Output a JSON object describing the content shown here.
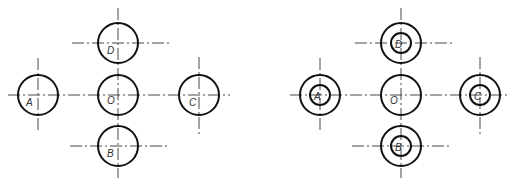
{
  "figures": [
    {
      "id": "left",
      "description": "Five single circles arranged in a cross with center lines",
      "circles": [
        {
          "label": "O",
          "cx": 118,
          "cy": 95,
          "r": 20,
          "inner_r": null
        },
        {
          "label": "D",
          "cx": 118,
          "cy": 43,
          "r": 20,
          "inner_r": null
        },
        {
          "label": "B",
          "cx": 118,
          "cy": 146,
          "r": 20,
          "inner_r": null
        },
        {
          "label": "A",
          "cx": 38,
          "cy": 95,
          "r": 20,
          "inner_r": null
        },
        {
          "label": "C",
          "cx": 199,
          "cy": 95,
          "r": 20,
          "inner_r": null
        }
      ]
    },
    {
      "id": "right",
      "description": "Center circle O with four concentric double circles A, B, C, D",
      "circles": [
        {
          "label": "O",
          "cx": 401,
          "cy": 95,
          "r": 20,
          "inner_r": null
        },
        {
          "label": "D",
          "cx": 401,
          "cy": 43,
          "r": 20,
          "inner_r": 10
        },
        {
          "label": "B",
          "cx": 401,
          "cy": 146,
          "r": 20,
          "inner_r": 10
        },
        {
          "label": "A",
          "cx": 320,
          "cy": 95,
          "r": 20,
          "inner_r": 10
        },
        {
          "label": "C",
          "cx": 480,
          "cy": 95,
          "r": 20,
          "inner_r": 10
        }
      ]
    }
  ],
  "labels": {
    "left": {
      "O": "O",
      "D": "D",
      "B": "B",
      "A": "A",
      "C": "C"
    },
    "right": {
      "O": "O",
      "D": "D",
      "B": "B",
      "A": "A",
      "C": "C"
    }
  },
  "colors": {
    "stroke": "#111111",
    "centerline": "#333333",
    "background": "#ffffff"
  }
}
